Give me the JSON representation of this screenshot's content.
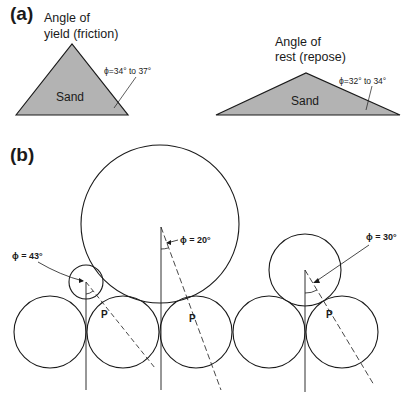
{
  "panel_a": {
    "label": "(a)",
    "left": {
      "title_line1": "Angle of",
      "title_line2": "yield (friction)",
      "material": "Sand",
      "angle": "ϕ=34° to 37°"
    },
    "right": {
      "title_line1": "Angle of",
      "title_line2": "rest (repose)",
      "material": "Sand",
      "angle": "ϕ=32° to 34°"
    }
  },
  "panel_b": {
    "label": "(b)",
    "angles": [
      {
        "label": "ϕ = 43°"
      },
      {
        "label": "ϕ = 20°"
      },
      {
        "label": "ϕ = 30°"
      }
    ],
    "contact_point_label": "P"
  },
  "colors": {
    "sand_fill": "#b3b3b3",
    "stroke": "#1a1a1a"
  }
}
